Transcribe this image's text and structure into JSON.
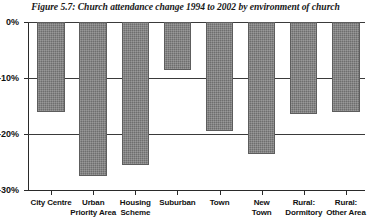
{
  "figure": {
    "title": "Figure 5.7: Church attendance change 1994 to 2002 by environment of church"
  },
  "chart_data": {
    "type": "bar",
    "title": "Figure 5.7: Church attendance change 1994 to 2002 by environment of church",
    "xlabel": "",
    "ylabel": "",
    "ylim": [
      -30,
      0
    ],
    "yticks": [
      0,
      -10,
      -20,
      -30
    ],
    "ytick_labels": [
      "0%",
      "-10%",
      "-20%",
      "-30%"
    ],
    "grid": true,
    "legend": "none",
    "orientation": "vertical",
    "units": "percent",
    "bar_color": "#6e6e6e",
    "categories": [
      "City Centre",
      "Urban Priority Area",
      "Housing Scheme",
      "Suburban",
      "Town",
      "New Town",
      "Rural: Dormitory",
      "Rural: Other Area"
    ],
    "category_lines": [
      [
        "City Centre",
        ""
      ],
      [
        "Urban",
        "Priority Area"
      ],
      [
        "Housing",
        "Scheme"
      ],
      [
        "Suburban",
        ""
      ],
      [
        "Town",
        ""
      ],
      [
        "New",
        "Town"
      ],
      [
        "Rural:",
        "Dormitory"
      ],
      [
        "Rural:",
        "Other Area"
      ]
    ],
    "values": [
      -16,
      -27.5,
      -25.5,
      -8.5,
      -19.5,
      -23.5,
      -16.5,
      -16
    ]
  }
}
